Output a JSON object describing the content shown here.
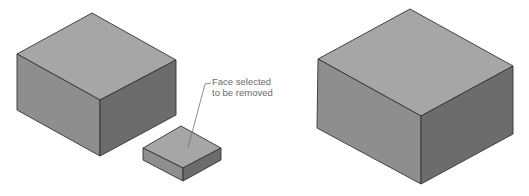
{
  "annotation": {
    "line1": "Face selected",
    "line2": "to be removed"
  },
  "colors": {
    "top_face": "#a6a6a6",
    "left_face": "#8e8e8e",
    "right_face": "#6c6c6c",
    "edge": "#333333",
    "leader": "#707070",
    "text": "#6a6a6a"
  },
  "shapes": {
    "left_large_box": {
      "top": [
        92,
        13
      ],
      "left": [
        17,
        54
      ],
      "right": [
        176,
        60
      ],
      "front": [
        100,
        100
      ],
      "left_bottom": [
        17,
        110
      ],
      "front_bottom": [
        100,
        156
      ],
      "right_bottom": [
        176,
        115
      ]
    },
    "small_box_selected_face": {
      "top": [
        181,
        126
      ],
      "left": [
        143,
        148
      ],
      "right": [
        221,
        148
      ],
      "front": [
        183,
        168
      ],
      "left_bottom": [
        143,
        160
      ],
      "front_bottom": [
        183,
        181
      ],
      "right_bottom": [
        221,
        160
      ]
    },
    "right_result_box": {
      "top": [
        410,
        9
      ],
      "left": [
        318,
        59
      ],
      "right": [
        513,
        66
      ],
      "front": [
        421,
        116
      ],
      "left_bottom": [
        317,
        128
      ],
      "front_bottom": [
        421,
        184
      ],
      "right_bottom": [
        513,
        134
      ]
    }
  }
}
